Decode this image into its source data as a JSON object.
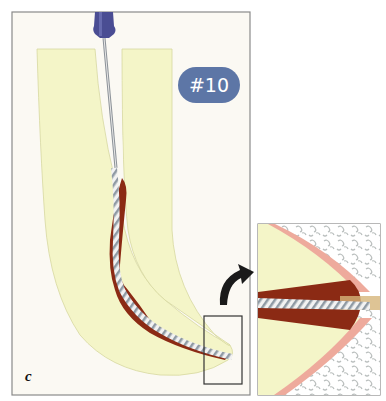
{
  "figure": {
    "panel_label": "c",
    "file_size_badge": "#10",
    "colors": {
      "background": "#fbf9f3",
      "frame": "#8a8a8a",
      "tooth": "#f4f5c8",
      "canal_tissue": "#8b2a14",
      "file_handle": "#4a4d93",
      "badge": "#5d76a6",
      "pdl": "#eeaa9c",
      "bone": "#c8cccb"
    },
    "main_panel": {
      "description": "Root canal with #10 endodontic file inserted to apex"
    },
    "inset_panel": {
      "description": "Magnified apical region showing file tip passing through apical foramen"
    }
  }
}
